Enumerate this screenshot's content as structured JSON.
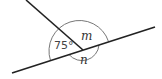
{
  "diagram": {
    "type": "intersecting-lines-angles",
    "labels": {
      "known_angle": "75°",
      "angle_m": "m",
      "angle_n": "n"
    },
    "colors": {
      "line": "#222222",
      "arc": "#777777",
      "text": "#333333",
      "background": "#ffffff"
    }
  }
}
